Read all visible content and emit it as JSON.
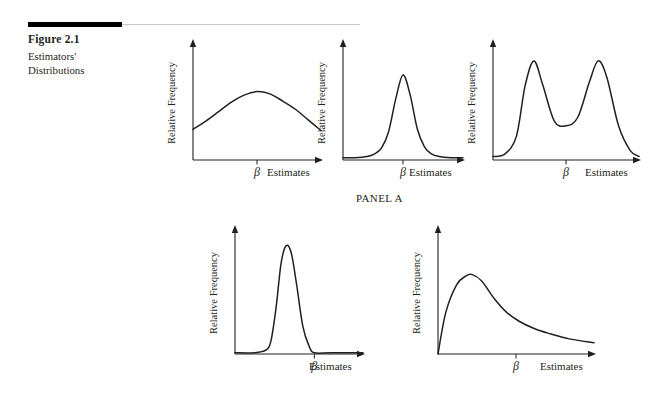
{
  "figure": {
    "number": "Figure 2.1",
    "caption": "Estimators' Distributions",
    "panel_label": "PANEL A"
  },
  "labels": {
    "y_axis": "Relative Frequency",
    "x_axis": "Estimates",
    "beta": "β"
  },
  "colors": {
    "ink": "#231f20",
    "rule_thick": "#000000",
    "rule_thin": "#c9c9c9",
    "background": "#ffffff"
  },
  "chart_data": [
    {
      "type": "line",
      "title": "Unbiased, high variance",
      "xlabel": "Estimates",
      "ylabel": "Relative Frequency",
      "annotations": [
        "β"
      ],
      "beta_x": 0.5,
      "peak_x": 0.5,
      "grid": false,
      "legend": "none",
      "xlim": [
        0,
        1
      ],
      "ylim": [
        0,
        1
      ],
      "x": [
        0.0,
        0.1,
        0.2,
        0.3,
        0.4,
        0.5,
        0.6,
        0.7,
        0.8,
        0.9,
        1.0
      ],
      "values": [
        0.26,
        0.33,
        0.41,
        0.49,
        0.55,
        0.58,
        0.56,
        0.5,
        0.43,
        0.34,
        0.25
      ]
    },
    {
      "type": "line",
      "title": "Unbiased, low variance",
      "xlabel": "Estimates",
      "ylabel": "Relative Frequency",
      "annotations": [
        "β"
      ],
      "beta_x": 0.5,
      "peak_x": 0.5,
      "grid": false,
      "legend": "none",
      "xlim": [
        0,
        1
      ],
      "ylim": [
        0,
        1
      ],
      "x": [
        0.0,
        0.1,
        0.2,
        0.26,
        0.32,
        0.38,
        0.44,
        0.5,
        0.56,
        0.62,
        0.68,
        0.74,
        0.8,
        0.9,
        1.0
      ],
      "values": [
        0.02,
        0.02,
        0.03,
        0.05,
        0.1,
        0.24,
        0.52,
        0.72,
        0.55,
        0.26,
        0.11,
        0.05,
        0.03,
        0.02,
        0.02
      ]
    },
    {
      "type": "line",
      "title": "Bimodal distribution",
      "xlabel": "Estimates",
      "ylabel": "Relative Frequency",
      "annotations": [
        "β"
      ],
      "beta_x": 0.5,
      "peak_x": 0.28,
      "grid": false,
      "legend": "none",
      "xlim": [
        0,
        1
      ],
      "ylim": [
        0,
        1
      ],
      "x": [
        0.0,
        0.08,
        0.16,
        0.22,
        0.28,
        0.34,
        0.42,
        0.5,
        0.58,
        0.66,
        0.72,
        0.78,
        0.86,
        0.94,
        1.0
      ],
      "values": [
        0.03,
        0.05,
        0.2,
        0.63,
        0.84,
        0.64,
        0.33,
        0.29,
        0.36,
        0.66,
        0.84,
        0.7,
        0.29,
        0.08,
        0.03
      ]
    },
    {
      "type": "line",
      "title": "Biased, very low variance",
      "xlabel": "Estimates",
      "ylabel": "Relative Frequency",
      "annotations": [
        "β"
      ],
      "beta_x": 0.62,
      "peak_x": 0.4,
      "grid": false,
      "legend": "none",
      "xlim": [
        0,
        1
      ],
      "ylim": [
        0,
        1
      ],
      "x": [
        0.0,
        0.15,
        0.24,
        0.28,
        0.32,
        0.36,
        0.4,
        0.44,
        0.48,
        0.53,
        0.58,
        0.62,
        0.75,
        1.0
      ],
      "values": [
        0.01,
        0.01,
        0.03,
        0.1,
        0.36,
        0.72,
        0.86,
        0.8,
        0.56,
        0.22,
        0.06,
        0.01,
        0.01,
        0.01
      ]
    },
    {
      "type": "line",
      "title": "Right-skewed distribution",
      "xlabel": "Estimates",
      "ylabel": "Relative Frequency",
      "annotations": [
        "β"
      ],
      "beta_x": 0.5,
      "peak_x": 0.22,
      "grid": false,
      "legend": "none",
      "xlim": [
        0,
        1
      ],
      "ylim": [
        0,
        1
      ],
      "x": [
        0.0,
        0.05,
        0.12,
        0.18,
        0.22,
        0.28,
        0.36,
        0.44,
        0.52,
        0.62,
        0.72,
        0.84,
        1.0
      ],
      "values": [
        0.0,
        0.33,
        0.55,
        0.62,
        0.63,
        0.58,
        0.44,
        0.33,
        0.26,
        0.2,
        0.16,
        0.12,
        0.09
      ]
    }
  ]
}
